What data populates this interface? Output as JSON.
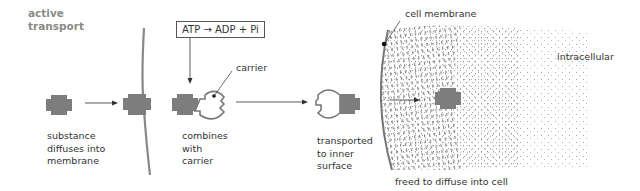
{
  "diagram": {
    "title": "active\ntransport",
    "equation": "ATP → ADP + Pi",
    "labels": {
      "carrier": "carrier",
      "cell_membrane": "cell membrane",
      "intracellular": "intracellular",
      "step1": "substance\ndiffuses into\nmembrane",
      "step2": "combines\nwith\ncarrier",
      "step3": "transported\nto inner\nsurface",
      "step4": "freed to diffuse into cell"
    },
    "colors": {
      "substance": "#7d7d7d",
      "membrane": "#8a8a8a",
      "title": "#8a8a8a",
      "text": "#333333",
      "stipple": "#8c8c8c"
    }
  }
}
